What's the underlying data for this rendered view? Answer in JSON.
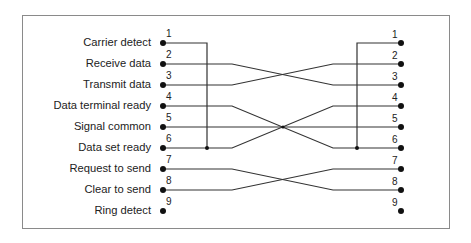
{
  "diagram": {
    "title": "",
    "left_connector": {
      "pins": [
        {
          "num": "1",
          "label": "Carrier detect"
        },
        {
          "num": "2",
          "label": "Receive data"
        },
        {
          "num": "3",
          "label": "Transmit data"
        },
        {
          "num": "4",
          "label": "Data terminal ready"
        },
        {
          "num": "5",
          "label": "Signal common"
        },
        {
          "num": "6",
          "label": "Data set ready"
        },
        {
          "num": "7",
          "label": "Request to send"
        },
        {
          "num": "8",
          "label": "Clear to send"
        },
        {
          "num": "9",
          "label": "Ring detect"
        }
      ]
    },
    "right_connector": {
      "pins": [
        {
          "num": "1"
        },
        {
          "num": "2"
        },
        {
          "num": "3"
        },
        {
          "num": "4"
        },
        {
          "num": "5"
        },
        {
          "num": "6"
        },
        {
          "num": "7"
        },
        {
          "num": "8"
        },
        {
          "num": "9"
        }
      ]
    },
    "connections": [
      {
        "from": "L1",
        "to": "L6",
        "type": "jumper"
      },
      {
        "from": "R1",
        "to": "R6",
        "type": "jumper"
      },
      {
        "from": "L2",
        "to": "R3"
      },
      {
        "from": "L3",
        "to": "R2"
      },
      {
        "from": "L4",
        "to": "R6"
      },
      {
        "from": "L5",
        "to": "R5"
      },
      {
        "from": "L6",
        "to": "R4"
      },
      {
        "from": "L7",
        "to": "R8"
      },
      {
        "from": "L8",
        "to": "R7"
      }
    ],
    "colors": {
      "line": "#333333",
      "border": "#8a8a8a",
      "text": "#222222"
    }
  }
}
